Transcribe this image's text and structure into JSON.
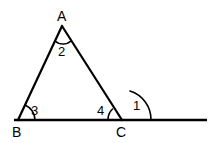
{
  "figure": {
    "kind": "geometry-diagram",
    "stroke_color": "#000000",
    "background_color": "#ffffff",
    "stroke_width": 2
  },
  "points": {
    "A": {
      "label": "A",
      "x": 62,
      "y": 26
    },
    "B": {
      "label": "B",
      "x": 18,
      "y": 120
    },
    "C": {
      "label": "C",
      "x": 122,
      "y": 120
    }
  },
  "segments": {
    "AB": {
      "name": "segment-ab",
      "x1": 62,
      "y1": 26,
      "x2": 18,
      "y2": 120
    },
    "AC": {
      "name": "segment-ac",
      "x1": 62,
      "y1": 26,
      "x2": 122,
      "y2": 120
    },
    "baseline": {
      "name": "segment-base-extended",
      "x1": 14,
      "y1": 120,
      "x2": 207,
      "y2": 120
    }
  },
  "angles": {
    "one": {
      "label": "1",
      "at_vertex": "C",
      "kind": "exterior",
      "arc_path": "M 132 94 A 22 22 0 0 1 144 120"
    },
    "two": {
      "label": "2",
      "at_vertex": "A",
      "kind": "interior",
      "arc_path": "M 55 41 A 12 12 0 0 0 71 41"
    },
    "three": {
      "label": "3",
      "at_vertex": "B",
      "kind": "interior",
      "arc_path": "M 25 105 A 17 17 0 0 1 35 120"
    },
    "four": {
      "label": "4",
      "at_vertex": "C",
      "kind": "interior",
      "arc_path": "M 108 120 A 16 16 0 0 1 113 108"
    }
  }
}
